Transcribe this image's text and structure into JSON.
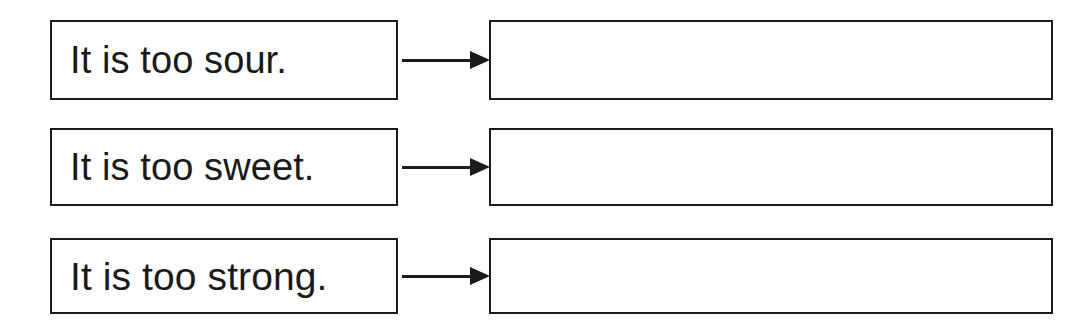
{
  "worksheet": {
    "background_color": "#ffffff",
    "line_color": "#1a1a1a",
    "rows": [
      {
        "prompt": "It is too sour.",
        "arrow": "right-arrow-icon",
        "answer": ""
      },
      {
        "prompt": "It is too sweet.",
        "arrow": "right-arrow-icon",
        "answer": ""
      },
      {
        "prompt": "It is too strong.",
        "arrow": "right-arrow-icon",
        "answer": ""
      }
    ]
  }
}
